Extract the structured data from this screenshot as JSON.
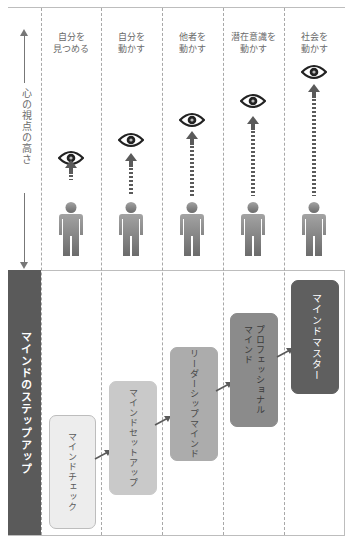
{
  "columns": [
    {
      "label": "自分を\n見つめる",
      "eye_top": 150,
      "arrow_top": 161,
      "dash_len": 14,
      "dashed": false
    },
    {
      "label": "自分を\n動かす",
      "eye_top": 134,
      "arrow_top": 153,
      "dash_len": 28,
      "dashed": true
    },
    {
      "label": "他者を\n動かす",
      "eye_top": 113,
      "arrow_top": 132,
      "dash_len": 48,
      "dashed": true
    },
    {
      "label": "潜在意識を\n動かす",
      "eye_top": 94,
      "arrow_top": 113,
      "dash_len": 67,
      "dashed": true
    },
    {
      "label": "社会を\n動かす",
      "eye_top": 63,
      "arrow_top": 82,
      "dash_len": 98,
      "dashed": true
    }
  ],
  "axis": {
    "label": "心の視点の高さ"
  },
  "sidebar": {
    "label": "マインドのステップアップ"
  },
  "steps": [
    {
      "label": "マインドチェック",
      "fill": "#ededed",
      "text_color": "#5a5a5a"
    },
    {
      "label": "マインドセットアップ",
      "fill": "#c9c9c9",
      "text_color": "#555555"
    },
    {
      "label": "リーダーシップマインド",
      "fill": "#acacac",
      "text_color": "#4a4a4a"
    },
    {
      "label": "プロフェッショナル\nマインド",
      "fill": "#8b8b8b",
      "text_color": "#3a3a3a"
    },
    {
      "label": "マインドマスター",
      "fill": "#5f5f5f",
      "text_color": "#ffffff"
    }
  ],
  "colors": {
    "dark": "#5a5a5a",
    "person_gradient_top": "#a0a0a0",
    "person_gradient_bottom": "#6c6c6c"
  }
}
